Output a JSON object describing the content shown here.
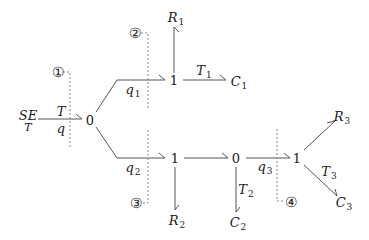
{
  "diagram": {
    "type": "bond-graph",
    "source": {
      "label_top": "SE",
      "label_bottom": "T"
    },
    "main_bond": {
      "effort": "T",
      "flow": "q"
    },
    "junctions": [
      {
        "id": "j0a",
        "label": "0"
      },
      {
        "id": "j1a",
        "label": "1"
      },
      {
        "id": "j1b",
        "label": "1"
      },
      {
        "id": "j0b",
        "label": "0"
      },
      {
        "id": "j1c",
        "label": "1"
      }
    ],
    "bond_labels": {
      "q1": {
        "base": "q",
        "sub": "1"
      },
      "q2": {
        "base": "q",
        "sub": "2"
      },
      "q3": {
        "base": "q",
        "sub": "3"
      },
      "T1": {
        "base": "T",
        "sub": "1"
      },
      "T2": {
        "base": "T",
        "sub": "2"
      },
      "T3": {
        "base": "T",
        "sub": "3"
      }
    },
    "elements": {
      "R1": {
        "base": "R",
        "sub": "1"
      },
      "R2": {
        "base": "R",
        "sub": "2"
      },
      "R3": {
        "base": "R",
        "sub": "3"
      },
      "C1": {
        "base": "C",
        "sub": "1"
      },
      "C2": {
        "base": "C",
        "sub": "2"
      },
      "C3": {
        "base": "C",
        "sub": "3"
      }
    },
    "section_markers": [
      "①",
      "②",
      "③",
      "④"
    ],
    "colors": {
      "line": "#555555",
      "dashed": "#888888",
      "text": "#1a1a1a"
    }
  }
}
